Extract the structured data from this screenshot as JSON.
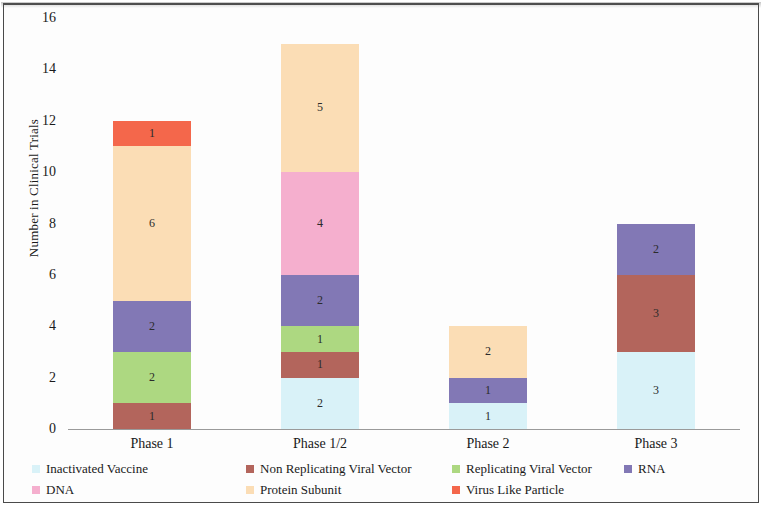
{
  "chart_data": {
    "type": "bar",
    "stacked": true,
    "title": "",
    "subtitle": "",
    "xlabel": "",
    "ylabel": "Number in Clinical Trials",
    "categories": [
      "Phase 1",
      "Phase 1/2",
      "Phase 2",
      "Phase 3"
    ],
    "ylim": [
      0,
      16
    ],
    "yticks": [
      0,
      2,
      4,
      6,
      8,
      10,
      12,
      14,
      16
    ],
    "ytick_labels": [
      "0",
      "2",
      "4",
      "6",
      "8",
      "10",
      "12",
      "14",
      "16"
    ],
    "grid": false,
    "legend_position": "bottom",
    "data_labels": true,
    "series": [
      {
        "name": "Inactivated Vaccine",
        "color": "#D9F2F8",
        "values": [
          0,
          2,
          1,
          3
        ]
      },
      {
        "name": "Non Replicating Viral Vector",
        "color": "#B3655C",
        "values": [
          1,
          1,
          0,
          3
        ]
      },
      {
        "name": "Replicating Viral Vector",
        "color": "#ADD881",
        "values": [
          2,
          1,
          0,
          0
        ]
      },
      {
        "name": "RNA",
        "color": "#8278B5",
        "values": [
          2,
          2,
          1,
          2
        ]
      },
      {
        "name": "DNA",
        "color": "#F5AFCE",
        "values": [
          0,
          4,
          0,
          0
        ]
      },
      {
        "name": "Protein Subunit",
        "color": "#FBDDB5",
        "values": [
          6,
          5,
          2,
          0
        ]
      },
      {
        "name": "Virus Like Particle",
        "color": "#F4674B",
        "values": [
          1,
          0,
          0,
          0
        ]
      }
    ],
    "totals": [
      12,
      15,
      4,
      8
    ]
  },
  "legend": {
    "rows": [
      [
        "Inactivated Vaccine",
        "Non Replicating Viral Vector",
        "Replicating Viral Vector",
        "RNA"
      ],
      [
        "DNA",
        "Protein Subunit",
        "Virus Like Particle"
      ]
    ]
  }
}
